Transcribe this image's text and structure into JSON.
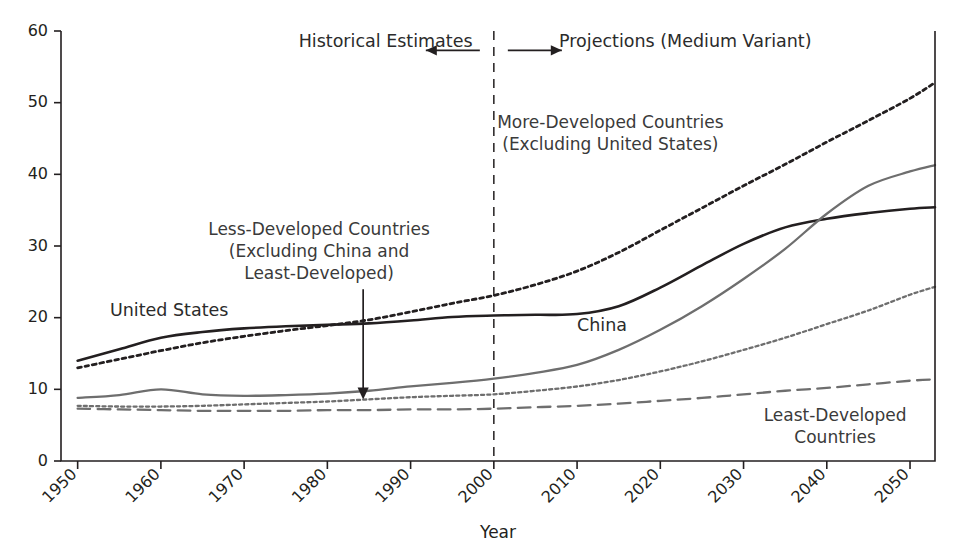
{
  "chart_data": {
    "type": "line",
    "title": "",
    "xlabel": "Year",
    "ylabel": "",
    "xlim": [
      1948,
      2053
    ],
    "ylim": [
      0,
      60
    ],
    "grid": false,
    "legend_position": "inline-annotations",
    "xticks": [
      1950,
      1960,
      1970,
      1980,
      1990,
      2000,
      2010,
      2020,
      2030,
      2040,
      2050
    ],
    "yticks": [
      0,
      10,
      20,
      30,
      40,
      50,
      60
    ],
    "x": [
      1950,
      1955,
      1960,
      1965,
      1970,
      1975,
      1980,
      1985,
      1990,
      1995,
      2000,
      2005,
      2010,
      2015,
      2020,
      2025,
      2030,
      2035,
      2040,
      2045,
      2050,
      2053
    ],
    "series": [
      {
        "name": "United States",
        "style": "solid",
        "color": "#231f20",
        "width": 2.6,
        "values": [
          14.0,
          15.6,
          17.2,
          18.0,
          18.5,
          18.8,
          19.0,
          19.2,
          19.6,
          20.1,
          20.3,
          20.4,
          20.5,
          21.6,
          24.2,
          27.3,
          30.3,
          32.6,
          33.8,
          34.6,
          35.2,
          35.4
        ]
      },
      {
        "name": "More-Developed Countries (Excluding United States)",
        "style": "dotted",
        "color": "#231f20",
        "width": 2.8,
        "values": [
          13.0,
          14.2,
          15.4,
          16.5,
          17.4,
          18.2,
          18.9,
          19.7,
          20.8,
          22.0,
          23.1,
          24.6,
          26.5,
          29.1,
          32.2,
          35.3,
          38.4,
          41.4,
          44.5,
          47.5,
          50.6,
          52.8
        ]
      },
      {
        "name": "China",
        "style": "solid",
        "color": "#6e6e6e",
        "width": 2.3,
        "values": [
          8.8,
          9.2,
          10.0,
          9.3,
          9.1,
          9.2,
          9.4,
          9.8,
          10.4,
          10.9,
          11.5,
          12.3,
          13.4,
          15.5,
          18.3,
          21.6,
          25.4,
          29.6,
          34.5,
          38.4,
          40.4,
          41.3
        ]
      },
      {
        "name": "Less-Developed Countries (Excluding China and Least-Developed)",
        "style": "dotted",
        "color": "#6e6e6e",
        "width": 2.3,
        "values": [
          7.7,
          7.6,
          7.6,
          7.7,
          7.9,
          8.1,
          8.3,
          8.6,
          8.9,
          9.1,
          9.3,
          9.8,
          10.4,
          11.3,
          12.5,
          13.9,
          15.5,
          17.2,
          19.1,
          21.0,
          23.2,
          24.3
        ]
      },
      {
        "name": "Least-Developed Countries",
        "style": "dashed",
        "color": "#6e6e6e",
        "width": 2.3,
        "values": [
          7.3,
          7.2,
          7.1,
          7.0,
          7.0,
          7.0,
          7.1,
          7.1,
          7.2,
          7.2,
          7.3,
          7.5,
          7.7,
          8.0,
          8.4,
          8.8,
          9.3,
          9.8,
          10.2,
          10.7,
          11.2,
          11.4
        ]
      }
    ],
    "annotations": [
      {
        "id": "historical",
        "text": "Historical Estimates",
        "x": 1987,
        "y": 57.8
      },
      {
        "id": "projections",
        "text": "Projections (Medium Variant)",
        "x": 2023,
        "y": 57.8
      },
      {
        "id": "more-developed",
        "line1": "More-Developed Countries",
        "line2": "(Excluding United States)",
        "x": 2014,
        "y": 46.5
      },
      {
        "id": "less-developed",
        "line1": "Less-Developed Countries",
        "line2": "(Excluding China and",
        "line3": "Least-Developed)",
        "x": 1979,
        "y": 31.5
      },
      {
        "id": "united-states",
        "text": "United States",
        "x": 1961,
        "y": 20.3
      },
      {
        "id": "china",
        "text": "China",
        "x": 2013,
        "y": 18.1
      },
      {
        "id": "least-developed",
        "line1": "Least-Developed",
        "line2": "Countries",
        "x": 2041,
        "y": 5.6
      }
    ],
    "divider_year": 2000
  },
  "labels": {
    "y_ticks": [
      "0",
      "10",
      "20",
      "30",
      "40",
      "50",
      "60"
    ],
    "x_ticks": [
      "1950",
      "1960",
      "1970",
      "1980",
      "1990",
      "2000",
      "2010",
      "2020",
      "2030",
      "2040",
      "2050"
    ],
    "xlabel": "Year",
    "historical": "Historical Estimates",
    "projections": "Projections (Medium Variant)",
    "more_developed_l1": "More-Developed Countries",
    "more_developed_l2": "(Excluding United States)",
    "less_developed_l1": "Less-Developed Countries",
    "less_developed_l2": "(Excluding China and",
    "less_developed_l3": "Least-Developed)",
    "united_states": "United States",
    "china": "China",
    "least_developed_l1": "Least-Developed",
    "least_developed_l2": "Countries"
  },
  "colors": {
    "axis": "#231f20",
    "dark_series": "#231f20",
    "gray_series": "#6e6e6e",
    "background": "#ffffff"
  }
}
